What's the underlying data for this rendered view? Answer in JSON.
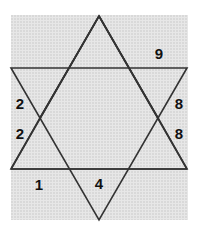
{
  "puzzle": {
    "description": "Six-pointed star formed by two overlapping triangles with numbers placed in regions",
    "background_color": "#e7e7e7",
    "line_color": "#333333",
    "numbers": {
      "top_right": "9",
      "left_upper": "2",
      "left_lower": "2",
      "right_upper": "8",
      "right_lower": "8",
      "bottom_left": "1",
      "bottom_center": "4"
    }
  }
}
